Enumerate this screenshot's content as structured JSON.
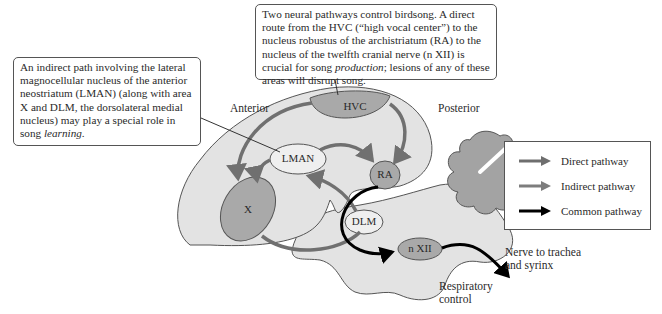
{
  "callouts": {
    "top": {
      "text_before_em": "Two neural pathways control birdsong. A direct route from the HVC (“high vocal center”) to the nucleus robustus of the archistriatum (RA) to the nucleus of the twelfth cranial nerve (n XII) is crucial for song ",
      "em": "production",
      "text_after_em": "; lesions of any of these areas will disrupt song."
    },
    "left": {
      "text_before_em": "An indirect path involving the lateral magnocellular nucleus of the anterior neostriatum (LMAN) (along with area X and DLM, the dorsolateral medial nucleus) may play a special role in song ",
      "em": "learning",
      "text_after_em": "."
    }
  },
  "labels": {
    "anterior": "Anterior",
    "posterior": "Posterior",
    "nerve_line1": "Nerve to trachea",
    "nerve_line2": "and syrinx",
    "resp_line1": "Respiratory",
    "resp_line2": "control"
  },
  "nodes": {
    "hvc": "HVC",
    "lman": "LMAN",
    "ra": "RA",
    "x": "X",
    "dlm": "DLM",
    "nxii": "n XII"
  },
  "legend": {
    "items": [
      {
        "label": "Direct pathway",
        "color": "#6e6e6e"
      },
      {
        "label": "Indirect pathway",
        "color": "#7d7d7d"
      },
      {
        "label": "Common pathway",
        "color": "#000000"
      }
    ]
  },
  "colors": {
    "brain_fill": "#e3e3e3",
    "nucleus_fill": "#a9a9a9",
    "light_nucleus_fill": "#efefef",
    "cerebellum_fill": "#a3a3a3",
    "arrow_gray": "#707070",
    "arrow_black": "#000000"
  }
}
